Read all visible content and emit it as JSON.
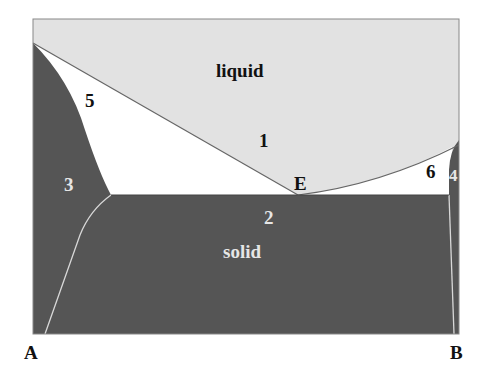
{
  "diagram": {
    "type": "binary eutectic phase diagram",
    "colors": {
      "liquid": "#e2e2e2",
      "two_phase": "#ffffff",
      "solid": "#555555",
      "frame": "#777777",
      "dark_text": "#111111",
      "light_text": "#e6e6e6"
    },
    "regions": {
      "liquid": "liquid",
      "solid": "solid"
    },
    "region_numbers": {
      "r1": "1",
      "r2": "2",
      "r3": "3",
      "r4": "4",
      "r5": "5",
      "r6": "6"
    },
    "points": {
      "eutectic": "E"
    },
    "axis": {
      "left": "A",
      "right": "B"
    }
  }
}
